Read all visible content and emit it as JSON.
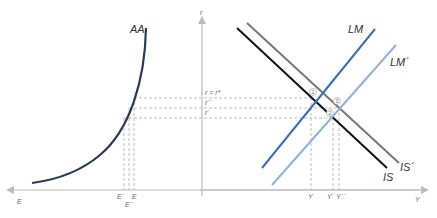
{
  "axes": {
    "vertical_label": "r",
    "horizontal_right_label": "Y",
    "horizontal_left_label": "E",
    "axis_color": "#bbbbbb"
  },
  "curves": {
    "aa": {
      "label": "AA",
      "color": "#2b3a55"
    },
    "is": {
      "label": "IS",
      "color": "#111111"
    },
    "is_prime": {
      "label": "IS´",
      "color": "#777777"
    },
    "lm": {
      "label": "LM",
      "color": "#3a6fb5"
    },
    "lm_prime": {
      "label": "LM´",
      "color": "#8fb3dc"
    }
  },
  "interest_levels": [
    {
      "label": "r = r*",
      "y": 98
    },
    {
      "label": "r´´",
      "y": 108
    },
    {
      "label": "r´",
      "y": 118
    }
  ],
  "output_levels": [
    {
      "label": "Y",
      "x": 311
    },
    {
      "label": "Y´",
      "x": 333
    },
    {
      "label": "Y´´",
      "x": 339
    }
  ],
  "exchange_levels": [
    {
      "label": "E´",
      "x": 124
    },
    {
      "label": "E´´",
      "x": 129
    },
    {
      "label": "E",
      "x": 134
    }
  ],
  "equilibrium_points": [
    {
      "label": "1",
      "x": 313,
      "y": 93
    },
    {
      "label": "2",
      "x": 330,
      "y": 113
    },
    {
      "label": "3",
      "x": 337,
      "y": 101
    }
  ],
  "guide_color": "#aaaaaa"
}
